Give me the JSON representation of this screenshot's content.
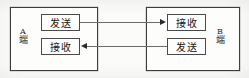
{
  "diagram": {
    "background_color": "#fbfbfa",
    "line_color": "#6d6d6d",
    "border_color": "#4a4a4a",
    "text_color": "#161616",
    "endpoints": [
      {
        "id": "a",
        "letter": "A",
        "suffix": "端",
        "boxes": [
          {
            "id": "a-send",
            "label": "发送",
            "role": "send"
          },
          {
            "id": "a-receive",
            "label": "接收",
            "role": "receive"
          }
        ]
      },
      {
        "id": "b",
        "letter": "B",
        "suffix": "端",
        "boxes": [
          {
            "id": "b-receive",
            "label": "接收",
            "role": "receive"
          },
          {
            "id": "b-send",
            "label": "发送",
            "role": "send"
          }
        ]
      }
    ],
    "connections": [
      {
        "id": "a-send-to-b-receive",
        "from": "a-send",
        "to": "b-receive",
        "direction": "right",
        "arrow_name": "arrow-right-icon"
      },
      {
        "id": "b-send-to-a-receive",
        "from": "b-send",
        "to": "a-receive",
        "direction": "left",
        "arrow_name": "arrow-left-icon"
      }
    ]
  }
}
